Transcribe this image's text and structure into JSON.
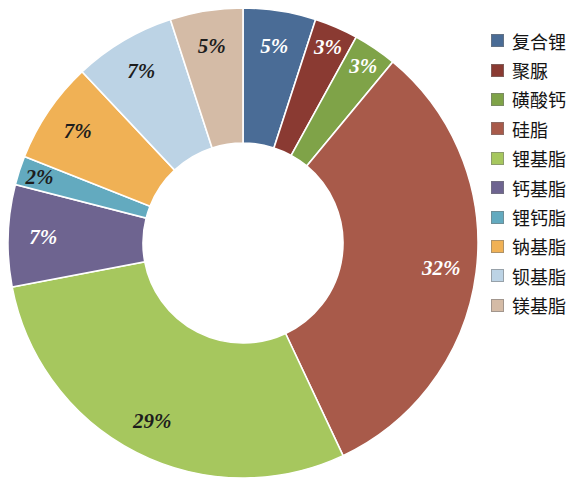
{
  "chart_data": {
    "type": "pie",
    "variant": "donut",
    "title": "",
    "subtitle": "",
    "xlabel": "",
    "ylabel": "",
    "grid": false,
    "legend_position": "right",
    "start_angle_deg": 0,
    "direction": "clockwise",
    "value_unit": "%",
    "categories": [
      "复合锂",
      "聚脲",
      "磺酸钙",
      "硅脂",
      "锂基脂",
      "钙基脂",
      "锂钙脂",
      "钠基脂",
      "钡基脂",
      "镁基脂"
    ],
    "values": [
      5,
      3,
      3,
      32,
      29,
      7,
      2,
      7,
      7,
      5
    ],
    "data_labels": [
      "5%",
      "3%",
      "3%",
      "32%",
      "29%",
      "7%",
      "2%",
      "7%",
      "7%",
      "5%"
    ],
    "colors": [
      "#4a6c96",
      "#8a3a32",
      "#7fa348",
      "#a85a4a",
      "#a6c75e",
      "#6e6490",
      "#63aabf",
      "#f0b155",
      "#bcd3e5",
      "#d4bba6"
    ],
    "label_text_colors": [
      "#ffffff",
      "#ffffff",
      "#ffffff",
      "#ffffff",
      "#1d1d1d",
      "#ffffff",
      "#1d1d1d",
      "#1d1d1d",
      "#1d1d1d",
      "#1d1d1d"
    ],
    "slices": [
      {
        "label": "复合锂",
        "value": 5,
        "display": "5%",
        "color": "#4a6c96",
        "text_color": "#ffffff"
      },
      {
        "label": "聚脲",
        "value": 3,
        "display": "3%",
        "color": "#8a3a32",
        "text_color": "#ffffff"
      },
      {
        "label": "磺酸钙",
        "value": 3,
        "display": "3%",
        "color": "#7fa348",
        "text_color": "#ffffff"
      },
      {
        "label": "硅脂",
        "value": 32,
        "display": "32%",
        "color": "#a85a4a",
        "text_color": "#ffffff"
      },
      {
        "label": "锂基脂",
        "value": 29,
        "display": "29%",
        "color": "#a6c75e",
        "text_color": "#1d1d1d"
      },
      {
        "label": "钙基脂",
        "value": 7,
        "display": "7%",
        "color": "#6e6490",
        "text_color": "#ffffff"
      },
      {
        "label": "锂钙脂",
        "value": 2,
        "display": "2%",
        "color": "#63aabf",
        "text_color": "#1d1d1d"
      },
      {
        "label": "钠基脂",
        "value": 7,
        "display": "7%",
        "color": "#f0b155",
        "text_color": "#1d1d1d"
      },
      {
        "label": "钡基脂",
        "value": 7,
        "display": "7%",
        "color": "#bcd3e5",
        "text_color": "#1d1d1d"
      },
      {
        "label": "镁基脂",
        "value": 5,
        "display": "5%",
        "color": "#d4bba6",
        "text_color": "#1d1d1d"
      }
    ]
  },
  "legend": {
    "items": [
      {
        "label": "复合锂",
        "color": "#4a6c96"
      },
      {
        "label": "聚脲",
        "color": "#8a3a32"
      },
      {
        "label": "磺酸钙",
        "color": "#7fa348"
      },
      {
        "label": "硅脂",
        "color": "#a85a4a"
      },
      {
        "label": "锂基脂",
        "color": "#a6c75e"
      },
      {
        "label": "钙基脂",
        "color": "#6e6490"
      },
      {
        "label": "锂钙脂",
        "color": "#63aabf"
      },
      {
        "label": "钠基脂",
        "color": "#f0b155"
      },
      {
        "label": "钡基脂",
        "color": "#bcd3e5"
      },
      {
        "label": "镁基脂",
        "color": "#d4bba6"
      }
    ]
  },
  "geometry": {
    "center_x": 243,
    "center_y": 243,
    "outer_radius": 235,
    "inner_radius": 100,
    "label_radius_ratio": 0.74
  }
}
